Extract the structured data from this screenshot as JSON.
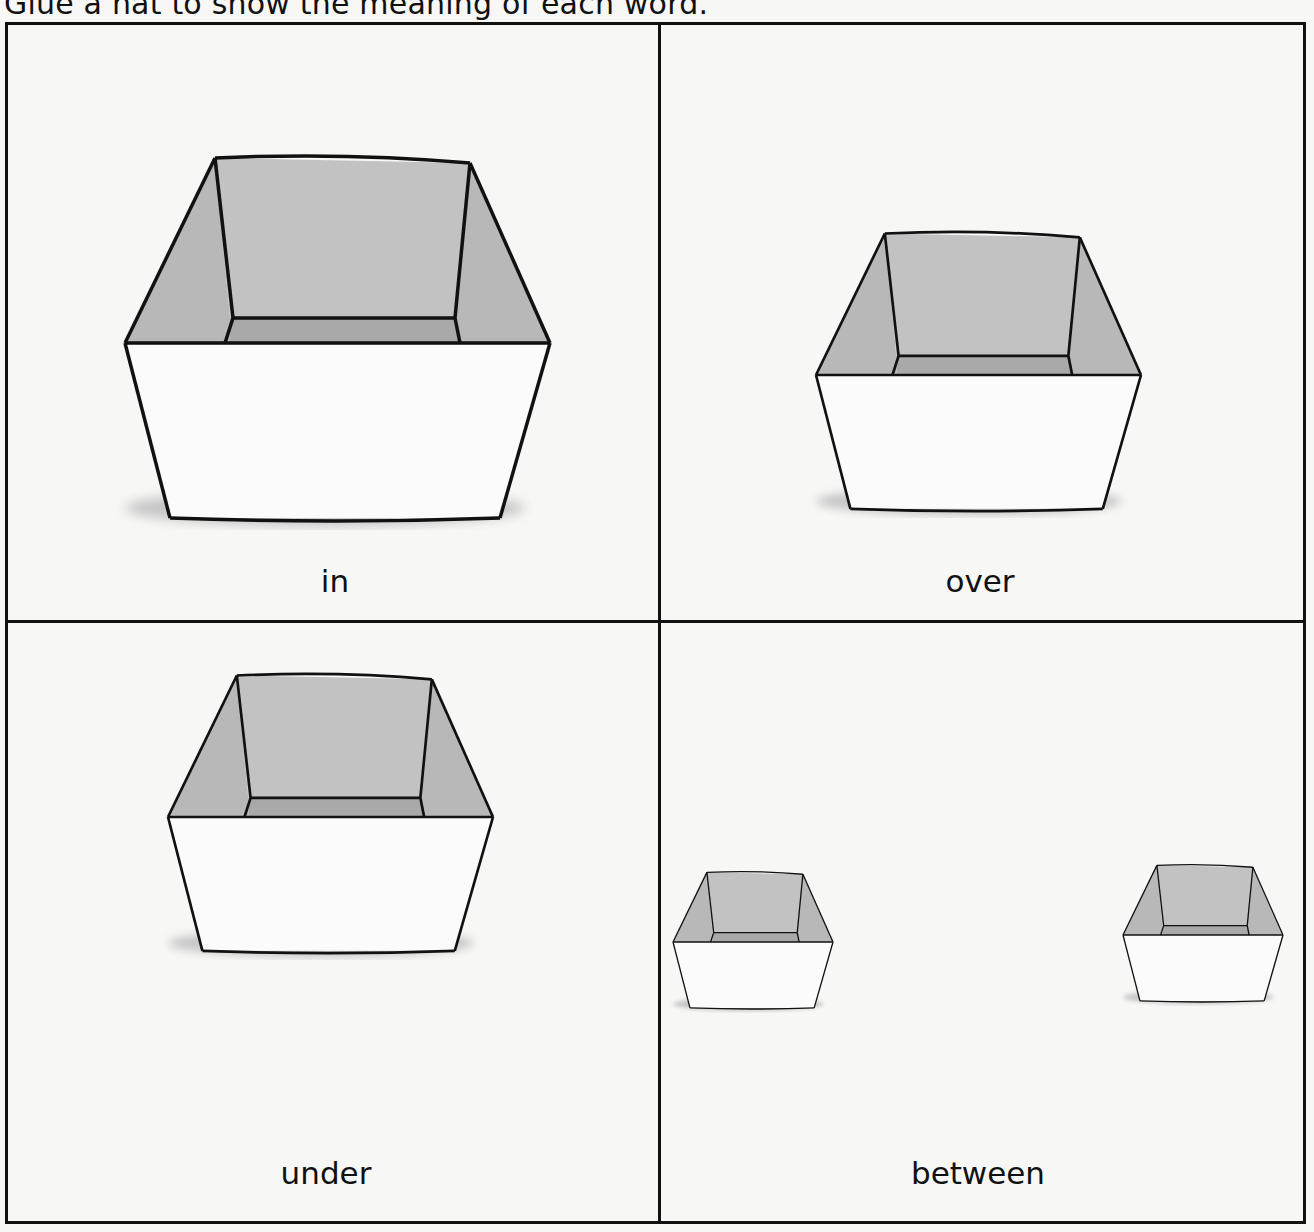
{
  "instruction": "Glue a hat to show the meaning of each word.",
  "panels": [
    {
      "id": "in",
      "label": "in"
    },
    {
      "id": "over",
      "label": "over"
    },
    {
      "id": "under",
      "label": "under"
    },
    {
      "id": "between",
      "label": "between"
    }
  ],
  "colors": {
    "outline": "#111111",
    "interior": "#bdbdbd",
    "shadow": "#c4c4c4",
    "paper": "#f7f7f6"
  }
}
